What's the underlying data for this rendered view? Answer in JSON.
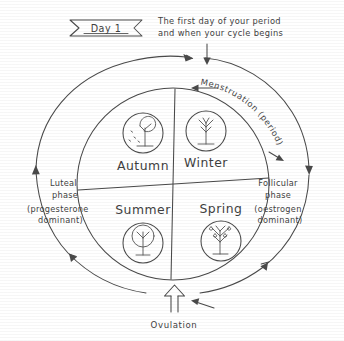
{
  "diagram": {
    "title_banner": "Day 1",
    "caption_line1": "The first day of your period",
    "caption_line2": "and when your cycle begins",
    "arc_top_label": "Menstruation (period)",
    "bottom_label": "Ovulation",
    "left_phase": {
      "line1": "Luteal",
      "line2": "phase",
      "line3": "(progesterone",
      "line4": "dominant)"
    },
    "right_phase": {
      "line1": "Follicular",
      "line2": "phase",
      "line3": "(oestrogen",
      "line4": "dominant)"
    },
    "quadrants": [
      {
        "label": "Autumn",
        "icon": "autumn-tree-icon"
      },
      {
        "label": "Winter",
        "icon": "winter-tree-icon"
      },
      {
        "label": "Summer",
        "icon": "summer-tree-icon"
      },
      {
        "label": "Spring",
        "icon": "spring-tree-icon"
      }
    ],
    "colors": {
      "ink": "#4a4a4a",
      "text": "#3f3f3f",
      "background": "#ffffff"
    }
  }
}
